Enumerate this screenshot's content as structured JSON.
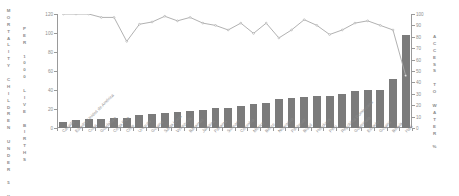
{
  "chart_data": {
    "type": "bar",
    "title": "",
    "subtitle": "",
    "ylabel": "MORTALITY CHILDREN UNDER 5 YEARS",
    "ylabel_secondary": "PER 1000 LIVE BIRTHS",
    "ylabel_right": "ACCESS TO WATER %",
    "xlabel": "",
    "ylim": [
      0,
      120
    ],
    "ylim_right": [
      0,
      100
    ],
    "yticks": [
      0,
      20,
      40,
      60,
      80,
      100,
      120
    ],
    "yticks_right": [
      0,
      10,
      20,
      30,
      40,
      50,
      60,
      70,
      80,
      90,
      100
    ],
    "grid": false,
    "legend": "none",
    "bar_color": "#7b7b7b",
    "line_color": "#a8a8a8",
    "axis_color": "#9a9a9a",
    "text_color": "#8b8b8b",
    "categories": [
      "Canadá",
      "Estados Unidos de América",
      "Cuba",
      "Guadalupe",
      "Costa Rica",
      "Chile",
      "Uruguay",
      "Guyana",
      "Santa Lucía",
      "Venezuela",
      "Bahamas",
      "Jamaica",
      "Panamá",
      "Surinam",
      "Colombia",
      "México",
      "Belice",
      "Nicaragua",
      "Paraguay",
      "Brasil",
      "Honduras",
      "Perú",
      "República Dominicana",
      "Guatemala",
      "Ecuador",
      "Guyana",
      "Bolivia",
      "Haití"
    ],
    "series": [
      {
        "name": "MORTALITY CHILDREN UNDER 5 YEARS PER 1000 LIVE BIRTHS",
        "type": "bar",
        "axis": "left",
        "values": [
          6,
          8,
          9,
          9,
          11,
          11,
          14,
          15,
          16,
          17,
          18,
          19,
          21,
          21,
          23,
          25,
          26,
          31,
          32,
          33,
          34,
          34,
          36,
          39,
          40,
          40,
          52,
          98
        ]
      },
      {
        "name": "ACCESS TO WATER %",
        "type": "line",
        "axis": "right",
        "values": [
          100,
          100,
          100,
          97,
          97,
          76,
          91,
          93,
          98,
          94,
          97,
          92,
          90,
          86,
          92,
          83,
          92,
          79,
          86,
          95,
          90,
          82,
          86,
          92,
          94,
          90,
          86,
          46
        ]
      }
    ]
  }
}
